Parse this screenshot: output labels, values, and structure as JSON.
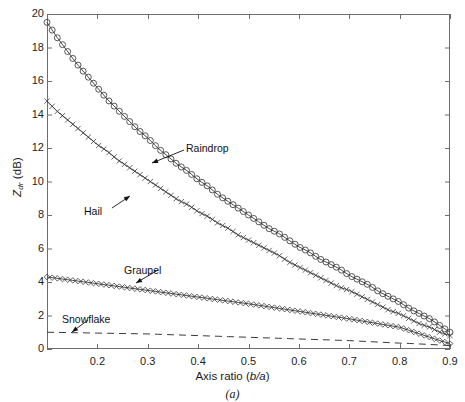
{
  "figure": {
    "caption": "(a)"
  },
  "axes": {
    "xlabel_prefix": "Axis ratio (",
    "xlabel_italic": "b/a",
    "xlabel_suffix": ")",
    "ylabel_main": "Z",
    "ylabel_sub": "dr",
    "ylabel_unit": " (dB)",
    "xticks": [
      "0.2",
      "0.3",
      "0.4",
      "0.5",
      "0.6",
      "0.7",
      "0.8",
      "0.9"
    ],
    "yticks": [
      "0",
      "2",
      "4",
      "6",
      "8",
      "10",
      "12",
      "14",
      "16",
      "18",
      "20"
    ]
  },
  "annotations": {
    "raindrop": "Raindrop",
    "hail": "Hail",
    "graupel": "Graupel",
    "snowflake": "Snowflake"
  },
  "colors": {
    "axis": "#6d6d6d",
    "curve": "#3a3a3a",
    "text": "#1a1a1a"
  },
  "chart_data": {
    "type": "line",
    "title": "",
    "xlabel": "Axis ratio (b/a)",
    "ylabel": "Zdr (dB)",
    "xlim": [
      0.1,
      0.9
    ],
    "ylim": [
      0,
      20
    ],
    "xticks": [
      0.2,
      0.3,
      0.4,
      0.5,
      0.6,
      0.7,
      0.8,
      0.9
    ],
    "yticks": [
      0,
      2,
      4,
      6,
      8,
      10,
      12,
      14,
      16,
      18,
      20
    ],
    "grid": false,
    "legend": "none (inline arrow annotations)",
    "x": [
      0.1,
      0.12,
      0.14,
      0.16,
      0.18,
      0.2,
      0.22,
      0.24,
      0.26,
      0.28,
      0.3,
      0.32,
      0.34,
      0.36,
      0.38,
      0.4,
      0.42,
      0.44,
      0.46,
      0.48,
      0.5,
      0.52,
      0.54,
      0.56,
      0.58,
      0.6,
      0.62,
      0.64,
      0.66,
      0.68,
      0.7,
      0.72,
      0.74,
      0.76,
      0.78,
      0.8,
      0.82,
      0.84,
      0.86,
      0.88,
      0.9
    ],
    "series": [
      {
        "name": "Raindrop",
        "marker": "circle",
        "linestyle": "solid",
        "values": [
          19.5,
          18.6,
          17.8,
          17.0,
          16.3,
          15.6,
          14.9,
          14.3,
          13.7,
          13.1,
          12.6,
          12.0,
          11.5,
          11.0,
          10.6,
          10.1,
          9.7,
          9.2,
          8.8,
          8.4,
          8.0,
          7.6,
          7.2,
          6.9,
          6.5,
          6.1,
          5.8,
          5.4,
          5.1,
          4.8,
          4.4,
          4.1,
          3.8,
          3.4,
          3.1,
          2.8,
          2.4,
          2.1,
          1.8,
          1.4,
          1.0
        ]
      },
      {
        "name": "Hail",
        "marker": "cross",
        "linestyle": "solid",
        "values": [
          14.8,
          14.2,
          13.7,
          13.2,
          12.7,
          12.2,
          11.8,
          11.3,
          10.9,
          10.5,
          10.1,
          9.7,
          9.3,
          8.9,
          8.6,
          8.2,
          7.9,
          7.5,
          7.2,
          6.8,
          6.5,
          6.2,
          5.9,
          5.6,
          5.2,
          4.9,
          4.6,
          4.3,
          4.0,
          3.7,
          3.5,
          3.2,
          2.9,
          2.6,
          2.3,
          2.1,
          1.8,
          1.5,
          1.3,
          1.0,
          0.8
        ]
      },
      {
        "name": "Graupel",
        "marker": "diamond",
        "linestyle": "solid",
        "values": [
          4.3,
          4.22,
          4.14,
          4.06,
          3.98,
          3.9,
          3.82,
          3.74,
          3.66,
          3.58,
          3.5,
          3.42,
          3.34,
          3.26,
          3.18,
          3.1,
          3.02,
          2.94,
          2.86,
          2.78,
          2.7,
          2.61,
          2.52,
          2.43,
          2.34,
          2.25,
          2.16,
          2.07,
          1.98,
          1.89,
          1.8,
          1.7,
          1.6,
          1.5,
          1.4,
          1.3,
          1.1,
          0.9,
          0.7,
          0.5,
          0.32
        ]
      },
      {
        "name": "Snowflake",
        "marker": "none",
        "linestyle": "dashed",
        "values": [
          1.0,
          0.99,
          0.98,
          0.97,
          0.96,
          0.95,
          0.94,
          0.93,
          0.92,
          0.91,
          0.9,
          0.88,
          0.86,
          0.84,
          0.82,
          0.8,
          0.78,
          0.76,
          0.74,
          0.72,
          0.7,
          0.68,
          0.66,
          0.64,
          0.62,
          0.6,
          0.58,
          0.56,
          0.54,
          0.52,
          0.5,
          0.47,
          0.44,
          0.41,
          0.38,
          0.35,
          0.33,
          0.3,
          0.27,
          0.24,
          0.2
        ]
      }
    ],
    "annotations": [
      {
        "text": "Raindrop",
        "points_to_series": "Raindrop"
      },
      {
        "text": "Hail",
        "points_to_series": "Hail"
      },
      {
        "text": "Graupel",
        "points_to_series": "Graupel"
      },
      {
        "text": "Snowflake",
        "points_to_series": "Snowflake"
      }
    ]
  }
}
